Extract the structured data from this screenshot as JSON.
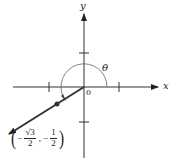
{
  "diagram": {
    "type": "unit-circle-angle",
    "axes": {
      "x_label": "x",
      "y_label": "y",
      "origin_label": "0"
    },
    "angle": {
      "label": "θ",
      "description": "angle measured counterclockwise from positive x-axis to terminal ray in quadrant III"
    },
    "point": {
      "x_sign": "−",
      "x_num": "√3",
      "x_num_radicand": "3",
      "x_den": "2",
      "separator": ",",
      "y_sign": "−",
      "y_num": "1",
      "y_den": "2",
      "open_paren": "(",
      "close_paren": ")"
    },
    "colors": {
      "line": "#333333",
      "text": "#222222",
      "arc": "#666666"
    }
  }
}
